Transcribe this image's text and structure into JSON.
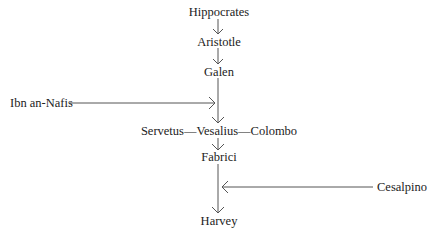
{
  "diagram": {
    "type": "lineage-flow",
    "nodes": [
      {
        "id": "hippocrates",
        "label": "Hippocrates"
      },
      {
        "id": "aristotle",
        "label": "Aristotle"
      },
      {
        "id": "galen",
        "label": "Galen"
      },
      {
        "id": "ibn-an-nafis",
        "label": "Ibn an-Nafis"
      },
      {
        "id": "servetus-vesalius-colombo",
        "label": "Servetus—Vesalius—Colombo"
      },
      {
        "id": "fabrici",
        "label": "Fabrici"
      },
      {
        "id": "cesalpino",
        "label": "Cesalpino"
      },
      {
        "id": "harvey",
        "label": "Harvey"
      }
    ],
    "edges": [
      {
        "from": "hippocrates",
        "to": "aristotle"
      },
      {
        "from": "aristotle",
        "to": "galen"
      },
      {
        "from": "galen",
        "to": "servetus-vesalius-colombo"
      },
      {
        "from": "ibn-an-nafis",
        "to": "galen-servetus-line"
      },
      {
        "from": "servetus-vesalius-colombo",
        "to": "fabrici"
      },
      {
        "from": "fabrici",
        "to": "harvey"
      },
      {
        "from": "cesalpino",
        "to": "fabrici-harvey-line"
      }
    ],
    "colors": {
      "line": "#555555",
      "text": "#222222"
    }
  }
}
